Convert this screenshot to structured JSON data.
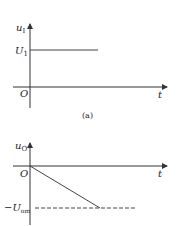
{
  "diagram_a": {
    "y_axis_label": "u",
    "y_axis_sub": "I",
    "level_label": "U",
    "level_sub": "1",
    "origin_label": "O",
    "x_axis_label": "t",
    "caption": "(a)"
  },
  "diagram_b": {
    "y_axis_label": "u",
    "y_axis_sub": "O",
    "origin_label": "O",
    "x_axis_label": "t",
    "level_label": "−U",
    "level_sub": "om"
  },
  "colors": {
    "line": "#333333",
    "text": "#222222"
  }
}
